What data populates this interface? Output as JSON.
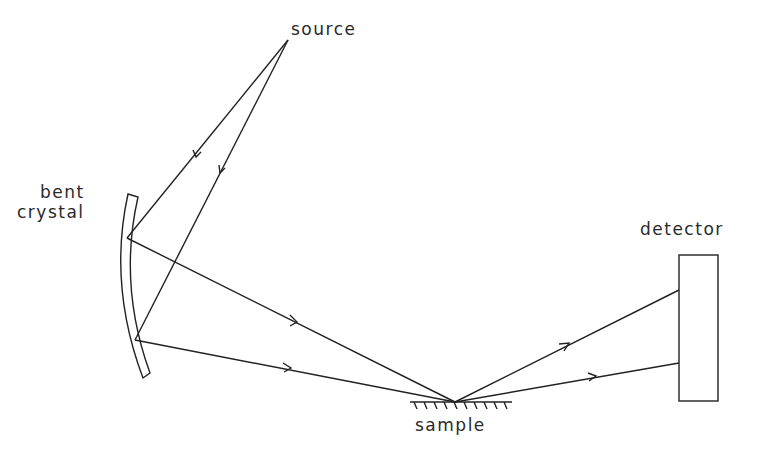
{
  "diagram": {
    "type": "x-ray focusing geometry schematic",
    "labels": {
      "source": "source",
      "bent_crystal_line1": "bent",
      "bent_crystal_line2": "crystal",
      "detector": "detector",
      "sample": "sample"
    },
    "components": [
      {
        "id": "source",
        "kind": "point source",
        "label": "source"
      },
      {
        "id": "bent-crystal",
        "kind": "curved crystal monochromator",
        "label": "bent crystal"
      },
      {
        "id": "sample",
        "kind": "flat sample surface (hatched)",
        "label": "sample"
      },
      {
        "id": "detector",
        "kind": "rectangular detector",
        "label": "detector"
      }
    ],
    "beams": [
      {
        "from": "source",
        "to": "bent-crystal (upper point)",
        "arrow": "toward crystal"
      },
      {
        "from": "source",
        "to": "bent-crystal (lower point)",
        "arrow": "toward crystal"
      },
      {
        "from": "bent-crystal (upper point)",
        "to": "sample",
        "arrow": "toward sample"
      },
      {
        "from": "bent-crystal (lower point)",
        "to": "sample",
        "arrow": "toward sample"
      },
      {
        "from": "sample",
        "to": "detector (upper point)",
        "arrow": "toward detector"
      },
      {
        "from": "sample",
        "to": "detector (lower point)",
        "arrow": "toward detector"
      }
    ],
    "colors": {
      "ink": "#222222",
      "background": "#ffffff"
    }
  }
}
